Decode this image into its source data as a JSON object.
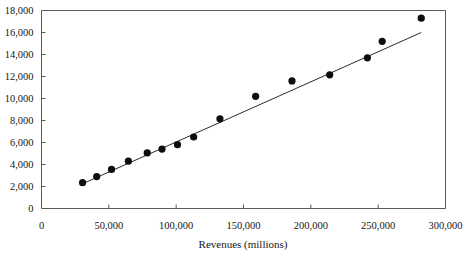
{
  "chart_data": {
    "type": "scatter",
    "title": "",
    "xlabel": "Revenues (millions)",
    "ylabel": "",
    "xlim": [
      0,
      300000
    ],
    "ylim": [
      0,
      18000
    ],
    "grid": false,
    "legend": null,
    "x_ticks": [
      0,
      50000,
      100000,
      150000,
      200000,
      250000,
      300000
    ],
    "x_tick_labels": [
      "0",
      "50,000",
      "100,000",
      "150,000",
      "200,000",
      "250,000",
      "300,000"
    ],
    "y_ticks": [
      0,
      2000,
      4000,
      6000,
      8000,
      10000,
      12000,
      14000,
      16000,
      18000
    ],
    "y_tick_labels": [
      "0",
      "2,000",
      "4,000",
      "6,000",
      "8,000",
      "10,000",
      "12,000",
      "14,000",
      "16,000",
      "18,000"
    ],
    "series": [
      {
        "name": "observations",
        "marker": "filled-circle",
        "marker_color": "#0d0d0d",
        "points": [
          {
            "x": 30500,
            "y": 2350
          },
          {
            "x": 41000,
            "y": 2900
          },
          {
            "x": 52000,
            "y": 3550
          },
          {
            "x": 64500,
            "y": 4300
          },
          {
            "x": 78500,
            "y": 5050
          },
          {
            "x": 89500,
            "y": 5400
          },
          {
            "x": 101000,
            "y": 5800
          },
          {
            "x": 113000,
            "y": 6500
          },
          {
            "x": 132500,
            "y": 8150
          },
          {
            "x": 159000,
            "y": 10200
          },
          {
            "x": 186000,
            "y": 11600
          },
          {
            "x": 214000,
            "y": 12150
          },
          {
            "x": 242000,
            "y": 13700
          },
          {
            "x": 253000,
            "y": 15200
          },
          {
            "x": 282000,
            "y": 17300
          }
        ]
      }
    ],
    "trendline": {
      "name": "linear-fit",
      "color": "#2b2b2b",
      "x_start": 30500,
      "y_start": 2250,
      "x_end": 282000,
      "y_end": 16000
    }
  }
}
